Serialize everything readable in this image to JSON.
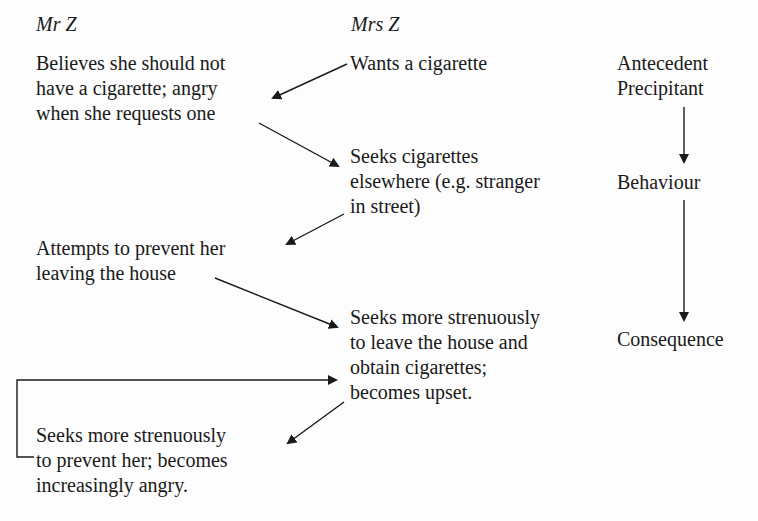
{
  "columns": {
    "mr_z": {
      "heading": "Mr Z"
    },
    "mrs_z": {
      "heading": "Mrs Z"
    }
  },
  "mr_z_steps": [
    {
      "lines": [
        "Believes she should not",
        "have a cigarette; angry",
        "when she requests one"
      ]
    },
    {
      "lines": [
        "Attempts to prevent her",
        "leaving the house"
      ]
    },
    {
      "lines": [
        "Seeks more strenuously",
        "to prevent her; becomes",
        "increasingly angry."
      ]
    }
  ],
  "mrs_z_steps": [
    {
      "lines": [
        "Wants a cigarette"
      ]
    },
    {
      "lines": [
        "Seeks cigarettes",
        "elsewhere (e.g. stranger",
        "in street)"
      ]
    },
    {
      "lines": [
        "Seeks more strenuously",
        "to leave the house and",
        "obtain cigarettes;",
        "becomes upset."
      ]
    }
  ],
  "abc_labels": {
    "antecedent": [
      "Antecedent",
      "Precipitant"
    ],
    "behaviour": "Behaviour",
    "consequence": "Consequence"
  },
  "colors": {
    "ink": "#1a1a1a",
    "background": "#fdfdfd"
  }
}
